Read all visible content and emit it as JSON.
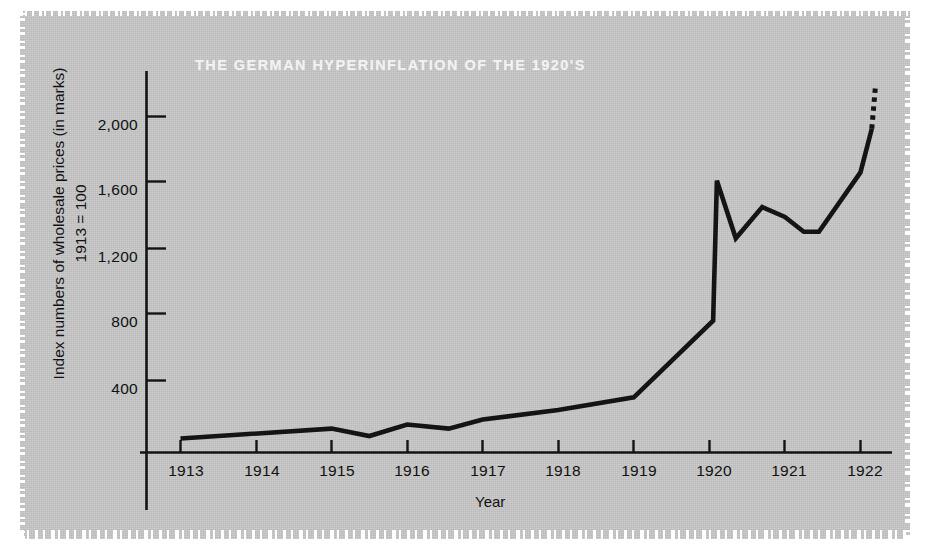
{
  "figure": {
    "title": "THE GERMAN HYPERINFLATION OF THE 1920'S",
    "background_color": "#c4c4c4",
    "ink_color": "#141414",
    "title_color": "#f2f2f2"
  },
  "axes": {
    "x_title": "Year",
    "y_title_line1": "Index numbers of wholesale prices (in marks)",
    "y_title_line2": "1913 = 100",
    "x_ticks": [
      "1913",
      "1914",
      "1915",
      "1916",
      "1917",
      "1918",
      "1919",
      "1920",
      "1921",
      "1922"
    ],
    "y_ticks": [
      "400",
      "800",
      "1,200",
      "1,600",
      "2,000"
    ]
  },
  "chart_data": {
    "type": "line",
    "title": "THE GERMAN HYPERINFLATION OF THE 1920'S",
    "xlabel": "Year",
    "ylabel": "Index numbers of wholesale prices (in marks), 1913 = 100",
    "xlim": [
      1912.55,
      1922.3
    ],
    "ylim": [
      0,
      2240
    ],
    "xticks": [
      1913,
      1914,
      1915,
      1916,
      1917,
      1918,
      1919,
      1920,
      1921,
      1922
    ],
    "xticklabels": [
      "1913",
      "1914",
      "1915",
      "1916",
      "1917",
      "1918",
      "1919",
      "1920",
      "1921",
      "1922"
    ],
    "yticks": [
      400,
      800,
      1200,
      1600,
      2000
    ],
    "yticklabels": [
      "400",
      "800",
      "1,200",
      "1,600",
      "2,000"
    ],
    "grid": false,
    "legend": false,
    "series": [
      {
        "name": "Wholesale price index",
        "style": "solid",
        "x": [
          1913.0,
          1915.0,
          1915.5,
          1916.0,
          1916.55,
          1917.0,
          1918.0,
          1919.0,
          1920.05,
          1920.1,
          1920.35,
          1920.7,
          1921.0,
          1921.25,
          1921.45,
          1922.0,
          1922.15
        ],
        "y": [
          85,
          145,
          100,
          170,
          145,
          200,
          258,
          335,
          800,
          1650,
          1300,
          1490,
          1430,
          1340,
          1340,
          1700,
          1965
        ]
      },
      {
        "name": "Projected continuation",
        "style": "dotted",
        "x": [
          1922.15,
          1922.2
        ],
        "y": [
          1965,
          2230
        ]
      }
    ]
  }
}
